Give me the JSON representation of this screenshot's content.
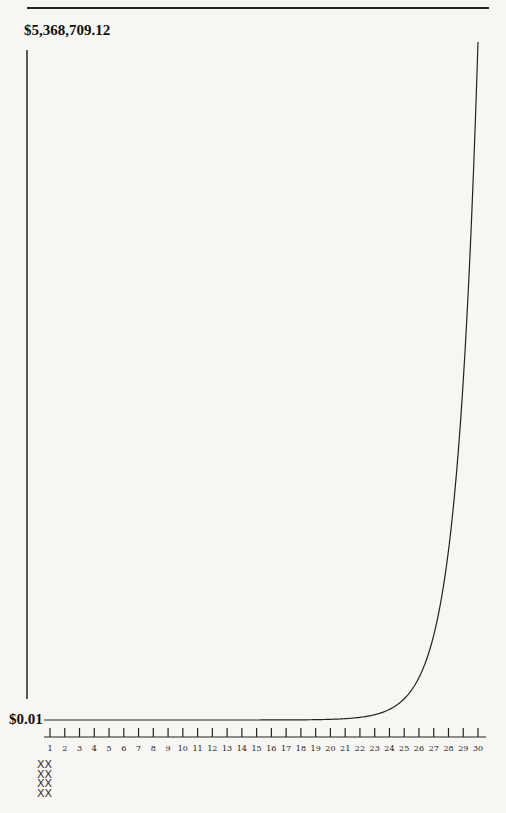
{
  "chart_data": {
    "type": "line",
    "title": "",
    "xlabel": "",
    "ylabel": "",
    "x": [
      1,
      2,
      3,
      4,
      5,
      6,
      7,
      8,
      9,
      10,
      11,
      12,
      13,
      14,
      15,
      16,
      17,
      18,
      19,
      20,
      21,
      22,
      23,
      24,
      25,
      26,
      27,
      28,
      29,
      30
    ],
    "series": [
      {
        "name": "Penny doubled daily",
        "values": [
          0.01,
          0.02,
          0.04,
          0.08,
          0.16,
          0.32,
          0.64,
          1.28,
          2.56,
          5.12,
          10.24,
          20.48,
          40.96,
          81.92,
          163.84,
          327.68,
          655.36,
          1310.72,
          2621.44,
          5242.88,
          10485.76,
          20971.52,
          41943.04,
          83886.08,
          167772.16,
          335544.32,
          671088.64,
          1342177.28,
          2684354.56,
          5368709.12
        ]
      }
    ],
    "ylim": [
      0.01,
      5368709.12
    ],
    "y_tick_labels": [
      "$0.01",
      "$5,368,709.12"
    ],
    "x_tick_labels": [
      "1",
      "2",
      "3",
      "4",
      "5",
      "6",
      "7",
      "8",
      "9",
      "10",
      "11",
      "12",
      "13",
      "14",
      "15",
      "16",
      "17",
      "18",
      "19",
      "20",
      "21",
      "22",
      "23",
      "24",
      "25",
      "26",
      "27",
      "28",
      "29",
      "30"
    ],
    "grid": false,
    "legend": null
  },
  "labels": {
    "ymax": "$5,368,709.12",
    "ymin": "$0.01"
  },
  "decoration": {
    "marks": "XX\nXX\nXX\nXX"
  }
}
